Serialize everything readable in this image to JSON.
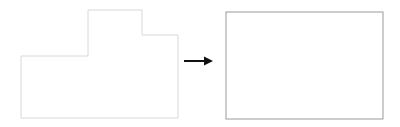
{
  "diagram": {
    "source_shape": {
      "type": "polygon",
      "points": [
        [
          21,
          56
        ],
        [
          88,
          56
        ],
        [
          88,
          10
        ],
        [
          142,
          10
        ],
        [
          142,
          35
        ],
        [
          178,
          35
        ],
        [
          178,
          118
        ],
        [
          21,
          118
        ]
      ],
      "stroke": "#d8d8d8"
    },
    "arrow": {
      "from": [
        184,
        61
      ],
      "to": [
        213,
        61
      ],
      "color": "#111111",
      "icon": "arrow-right-icon"
    },
    "target_shape": {
      "type": "rectangle",
      "x": 226,
      "y": 12,
      "width": 157,
      "height": 107,
      "stroke": "#9a9a9a"
    }
  }
}
